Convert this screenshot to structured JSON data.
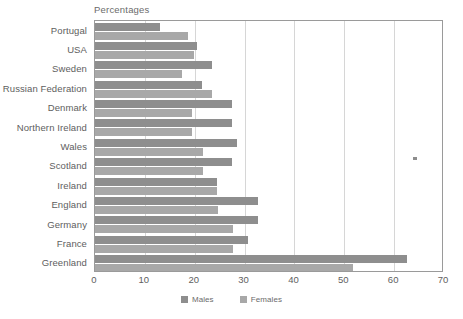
{
  "chart_data": {
    "type": "bar",
    "orientation": "horizontal",
    "title": "Percentages",
    "xlabel": "",
    "ylabel": "",
    "xlim": [
      0,
      70
    ],
    "xticks": [
      0,
      10,
      20,
      30,
      40,
      50,
      60,
      70
    ],
    "grid": "vertical",
    "legend_position": "bottom-center",
    "categories": [
      "Portugal",
      "USA",
      "Sweden",
      "Russian Federation",
      "Denmark",
      "Northern Ireland",
      "Wales",
      "Scotland",
      "Ireland",
      "England",
      "Germany",
      "France",
      "Greenland"
    ],
    "series": [
      {
        "name": "Males",
        "color": "#8e8e8e",
        "values": [
          13,
          20.5,
          23.5,
          21.5,
          27.5,
          27.5,
          28.5,
          27.5,
          24.5,
          32.7,
          32.7,
          30.7,
          62.5
        ]
      },
      {
        "name": "Females",
        "color": "#a8a8a8",
        "values": [
          18.6,
          19.8,
          17.5,
          23.5,
          19.5,
          19.5,
          21.7,
          21.7,
          24.5,
          24.7,
          27.7,
          27.7,
          51.8
        ]
      }
    ]
  },
  "legend": {
    "items": [
      {
        "label": "Males",
        "key": "males"
      },
      {
        "label": "Females",
        "key": "females"
      }
    ]
  }
}
